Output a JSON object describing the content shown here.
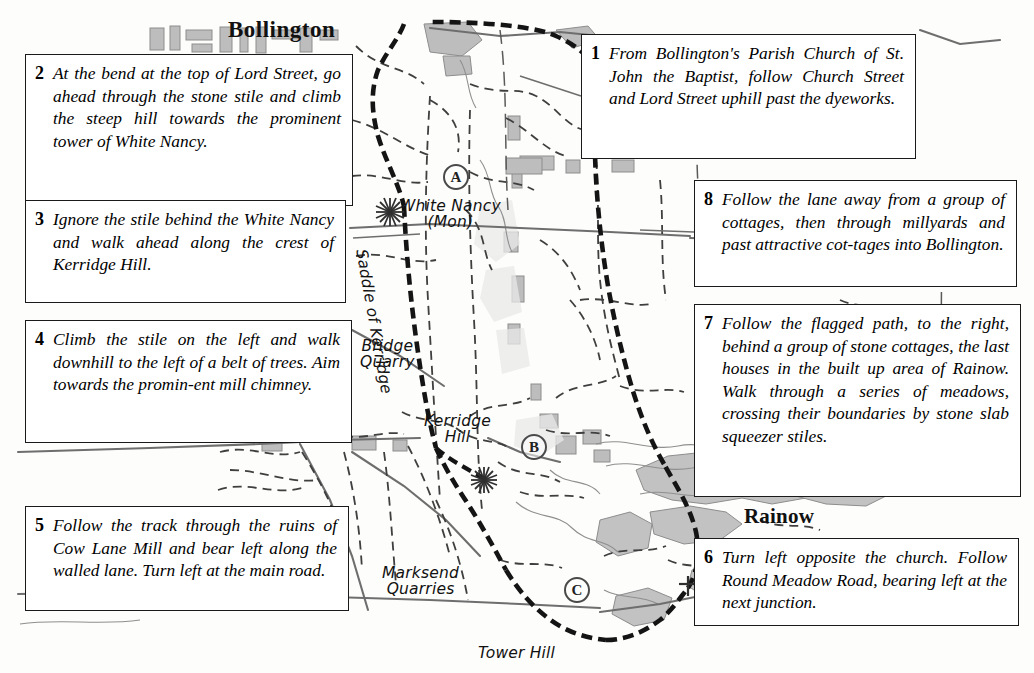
{
  "map": {
    "title": "Bollington and Kerridge Hill walking route map",
    "places": [
      {
        "name": "Bollington",
        "label": "Bollington"
      },
      {
        "name": "Rainow",
        "label": "Rainow"
      },
      {
        "name": "White Nancy",
        "label": "White Nancy",
        "sublabel": "(Mon)"
      },
      {
        "name": "Bridge Quarry",
        "line1": "Bridge",
        "line2": "Quarry"
      },
      {
        "name": "Kerridge Hill",
        "line1": "Kerridge",
        "line2": "Hill"
      },
      {
        "name": "Marksend Quarries",
        "line1": "Marksend",
        "line2": "Quarries"
      },
      {
        "name": "Tower Hill",
        "label": "Tower Hill"
      },
      {
        "name": "Saddle of Kerridge",
        "label": "Saddle of Kerridge"
      }
    ],
    "markers": [
      {
        "id": "A",
        "label": "A"
      },
      {
        "id": "B",
        "label": "B"
      },
      {
        "id": "C",
        "label": "C"
      }
    ],
    "colors": {
      "paper": "#fdfdfb",
      "built_up": "#b9b9b9",
      "woodland": "#c9c9c9",
      "route": "#1a1a1a",
      "footpath": "#3c3c3c",
      "road": "#6e6e6e",
      "water": "#8a8a8a"
    }
  },
  "instructions": [
    {
      "number": "1",
      "text": "From Bollington's Parish Church of St. John the Baptist, follow Church Street and Lord Street uphill past the dyeworks."
    },
    {
      "number": "2",
      "text": "At the bend at the top of Lord Street, go ahead through the stone stile and climb the steep hill towards the prominent tower of White Nancy."
    },
    {
      "number": "3",
      "text": "Ignore the stile behind the White Nancy and walk ahead along the crest of Kerridge Hill."
    },
    {
      "number": "4",
      "text": "Climb the stile on the left and walk downhill to the left of a belt of trees. Aim towards the promin-ent mill chimney."
    },
    {
      "number": "5",
      "text": "Follow the track through the ruins of Cow Lane Mill and bear left along the walled lane. Turn left at the main road."
    },
    {
      "number": "6",
      "text": "Turn left opposite the church. Follow Round Meadow Road, bearing left at the next junction."
    },
    {
      "number": "7",
      "text": "Follow the flagged path, to the right, behind a group of stone cottages, the last houses in the built up area of Rainow. Walk through a series of meadows, crossing their boundaries by stone slab squeezer stiles."
    },
    {
      "number": "8",
      "text": "Follow the lane away from a group of cottages, then through millyards and past attractive cot-tages into Bollington."
    }
  ]
}
